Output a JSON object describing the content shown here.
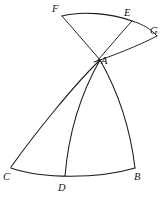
{
  "figure": {
    "background_color": "#ffffff",
    "ink_color": "#1c1a18",
    "width": 166,
    "height": 204,
    "labels": [
      {
        "id": "F",
        "text": "F",
        "x": 52,
        "y": 4
      },
      {
        "id": "E",
        "text": "E",
        "x": 124,
        "y": 8
      },
      {
        "id": "G",
        "text": "G",
        "x": 150,
        "y": 26
      },
      {
        "id": "A",
        "text": "A",
        "x": 101,
        "y": 56
      },
      {
        "id": "C",
        "text": "C",
        "x": 3,
        "y": 172
      },
      {
        "id": "D",
        "text": "D",
        "x": 58,
        "y": 183
      },
      {
        "id": "B",
        "text": "B",
        "x": 134,
        "y": 172
      }
    ],
    "vertices": {
      "A": {
        "x": 99,
        "y": 59
      },
      "B": {
        "x": 135,
        "y": 168
      },
      "C": {
        "x": 11,
        "y": 168
      },
      "D": {
        "x": 65,
        "y": 176
      },
      "E": {
        "x": 132,
        "y": 20
      },
      "F": {
        "x": 62,
        "y": 16
      },
      "G": {
        "x": 156,
        "y": 35
      }
    },
    "paths": [
      {
        "id": "arc-F-E",
        "name": "arc-f-e",
        "kind": "arc",
        "from": "F",
        "to": "E",
        "d": "M 62,16 C 82,11 110,13 132,21"
      },
      {
        "id": "arc-E-G",
        "name": "arc-e-g",
        "kind": "arc",
        "from": "E",
        "to": "G",
        "d": "M 132,21 C 143,24 152,30 157,36"
      },
      {
        "id": "line-F-A",
        "name": "line-f-a",
        "kind": "line",
        "from": "F",
        "to": "A",
        "d": "M 62,16 L 101,61"
      },
      {
        "id": "line-E-A",
        "name": "line-e-a",
        "kind": "line",
        "from": "E",
        "to": "A",
        "d": "M 132,21 C 120,34 107,50 97,61"
      },
      {
        "id": "arc-A-G",
        "name": "arc-a-g",
        "kind": "arc",
        "from": "A",
        "to": "G",
        "d": "M 94,62 C 112,56 138,46 157,36"
      },
      {
        "id": "curve-A-C",
        "name": "curve-a-c",
        "kind": "arc",
        "from": "A",
        "to": "C",
        "d": "M 100,60 C 74,85 36,132 11,167"
      },
      {
        "id": "curve-A-D",
        "name": "curve-a-d",
        "kind": "arc",
        "from": "A",
        "to": "D",
        "d": "M 100,60 C 84,88 69,128 65,176"
      },
      {
        "id": "curve-A-B",
        "name": "curve-a-b",
        "kind": "arc",
        "from": "A",
        "to": "B",
        "d": "M 100,60 C 116,88 130,126 135,168"
      },
      {
        "id": "arc-C-B",
        "name": "arc-c-b",
        "kind": "arc",
        "from": "C",
        "to": "B",
        "d": "M 11,168 C 42,179 98,179 135,168"
      }
    ]
  }
}
